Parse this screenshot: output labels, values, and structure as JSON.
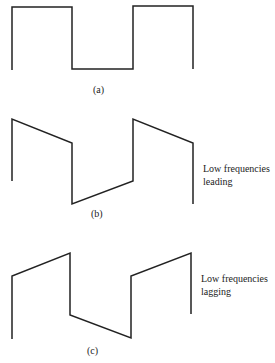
{
  "figures": [
    {
      "id": "a",
      "label": "(a)",
      "caption": ""
    },
    {
      "id": "b",
      "label": "(b)",
      "caption_lines": [
        "Low frequencies",
        "leading"
      ]
    },
    {
      "id": "c",
      "label": "(c)",
      "caption_lines": [
        "Low frequencies",
        "lagging"
      ]
    }
  ]
}
